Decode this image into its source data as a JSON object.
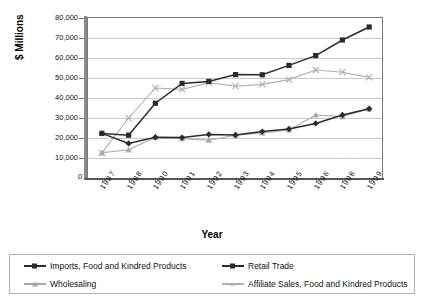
{
  "title": "",
  "axes": {
    "ylabel": "$ Millions",
    "xlabel": "Year",
    "yticks": [
      "80,000",
      "70,000",
      "60,000",
      "50,000",
      "40,000",
      "30,000",
      "20,000",
      "10,000"
    ],
    "zero_label": "0"
  },
  "legend": {
    "items": [
      {
        "label": "Imports, Food and Kindred Products",
        "marker": "diamond-marker",
        "color": "#2b2b2b"
      },
      {
        "label": "Retail Trade",
        "marker": "square-marker",
        "color": "#2b2b2b"
      },
      {
        "label": "Wholesaling",
        "marker": "triangle-marker",
        "color": "#a8a8a8"
      },
      {
        "label": "Affiliate Sales, Food and Kindred Products",
        "marker": "x-marker",
        "color": "#b0b0b0"
      }
    ]
  },
  "chart_data": {
    "type": "line",
    "title": "",
    "xlabel": "Year",
    "ylabel": "$ Millions",
    "categories": [
      "1987",
      "1988",
      "1990",
      "1991",
      "1992",
      "1993",
      "1994",
      "1995",
      "1996",
      "1998",
      "1999"
    ],
    "ylim": [
      0,
      80000
    ],
    "ytick_values": [
      0,
      10000,
      20000,
      30000,
      40000,
      50000,
      60000,
      70000,
      80000
    ],
    "grid": true,
    "legend_position": "bottom",
    "series": [
      {
        "name": "Imports, Food and Kindred Products",
        "marker": "diamond",
        "color": "#2b2b2b",
        "values": [
          22300,
          17300,
          20400,
          20200,
          21800,
          21500,
          23200,
          24500,
          27300,
          31500,
          34600
        ]
      },
      {
        "name": "Retail Trade",
        "marker": "square",
        "color": "#2b2b2b",
        "values": [
          22300,
          21400,
          37400,
          47300,
          48300,
          51700,
          51600,
          56300,
          61200,
          69000,
          75500
        ]
      },
      {
        "name": "Wholesaling",
        "marker": "triangle",
        "color": "#a8a8a8",
        "values": [
          12600,
          14100,
          20400,
          19700,
          18900,
          21400,
          22500,
          24000,
          31500,
          30700,
          34600
        ]
      },
      {
        "name": "Affiliate Sales, Food and Kindred Products",
        "marker": "x",
        "color": "#b0b0b0",
        "values": [
          12600,
          30000,
          45000,
          44300,
          47700,
          45900,
          46800,
          49200,
          54000,
          52900,
          50300
        ]
      }
    ]
  }
}
